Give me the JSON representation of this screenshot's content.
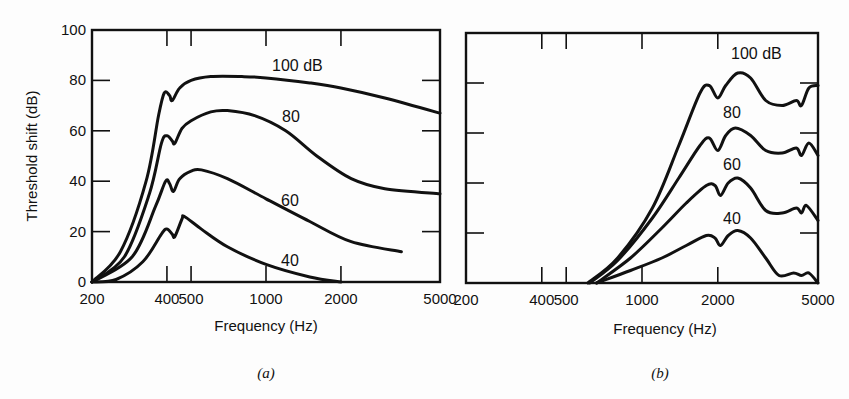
{
  "figure": {
    "panels": [
      {
        "tag": "(a)",
        "xlabel": "Frequency (Hz)",
        "ylabel": "Threshold shift (dB)"
      },
      {
        "tag": "(b)",
        "xlabel": "Frequency (Hz)",
        "ylabel": ""
      }
    ]
  },
  "chart_data": [
    {
      "type": "line",
      "title": "(a)",
      "xlabel": "Frequency (Hz)",
      "ylabel": "Threshold shift (dB)",
      "xscale": "log",
      "xlim": [
        200,
        5000
      ],
      "ylim": [
        0,
        100
      ],
      "xticks": [
        200,
        400,
        500,
        1000,
        2000,
        5000
      ],
      "yticks": [
        0,
        20,
        40,
        60,
        80,
        100
      ],
      "grid": false,
      "legend": "inline curve labels",
      "series": [
        {
          "name": "100 dB",
          "label": "100 dB",
          "points": [
            [
              200,
              0
            ],
            [
              260,
              12
            ],
            [
              330,
              40
            ],
            [
              370,
              66
            ],
            [
              390,
              75
            ],
            [
              410,
              74
            ],
            [
              420,
              72
            ],
            [
              450,
              77
            ],
            [
              500,
              80
            ],
            [
              600,
              81.5
            ],
            [
              800,
              81.5
            ],
            [
              1000,
              81
            ],
            [
              1500,
              79
            ],
            [
              2000,
              77
            ],
            [
              3000,
              73
            ],
            [
              5000,
              67
            ]
          ]
        },
        {
          "name": "80 dB",
          "label": "80",
          "points": [
            [
              200,
              0
            ],
            [
              270,
              10
            ],
            [
              340,
              35
            ],
            [
              380,
              55
            ],
            [
              400,
              58
            ],
            [
              420,
              56
            ],
            [
              430,
              55
            ],
            [
              460,
              61
            ],
            [
              500,
              64
            ],
            [
              600,
              67.5
            ],
            [
              700,
              68
            ],
            [
              900,
              66
            ],
            [
              1200,
              60
            ],
            [
              1600,
              50
            ],
            [
              2200,
              41
            ],
            [
              3000,
              37
            ],
            [
              5000,
              35
            ]
          ]
        },
        {
          "name": "60 dB",
          "label": "60",
          "points": [
            [
              200,
              0
            ],
            [
              290,
              10
            ],
            [
              360,
              30
            ],
            [
              395,
              40
            ],
            [
              410,
              39
            ],
            [
              425,
              36
            ],
            [
              450,
              41
            ],
            [
              500,
              44
            ],
            [
              550,
              44.5
            ],
            [
              700,
              41
            ],
            [
              1000,
              33
            ],
            [
              1500,
              24
            ],
            [
              2200,
              16
            ],
            [
              3500,
              12
            ]
          ]
        },
        {
          "name": "40 dB",
          "label": "40",
          "points": [
            [
              200,
              0
            ],
            [
              250,
              1
            ],
            [
              320,
              8
            ],
            [
              380,
              19
            ],
            [
              400,
              21
            ],
            [
              420,
              19
            ],
            [
              430,
              18
            ],
            [
              460,
              25
            ],
            [
              470,
              26
            ],
            [
              550,
              21
            ],
            [
              700,
              14
            ],
            [
              1000,
              7
            ],
            [
              1500,
              2
            ],
            [
              2000,
              0
            ]
          ]
        }
      ],
      "labels": {
        "curve_100": "100 dB",
        "curve_80": "80",
        "curve_60": "60",
        "curve_40": "40"
      }
    },
    {
      "type": "line",
      "title": "(b)",
      "xlabel": "Frequency (Hz)",
      "ylabel": "",
      "xscale": "log",
      "xlim": [
        200,
        5000
      ],
      "ylim": [
        0,
        100
      ],
      "xticks": [
        200,
        400,
        500,
        1000,
        2000,
        5000
      ],
      "yticks": [
        0,
        20,
        40,
        60,
        80,
        100
      ],
      "grid": false,
      "legend": "inline curve labels",
      "series": [
        {
          "name": "100 dB",
          "label": "100 dB",
          "points": [
            [
              610,
              0
            ],
            [
              800,
              10
            ],
            [
              1100,
              30
            ],
            [
              1400,
              55
            ],
            [
              1700,
              76
            ],
            [
              1850,
              79
            ],
            [
              2000,
              74
            ],
            [
              2150,
              79
            ],
            [
              2400,
              84
            ],
            [
              2700,
              82
            ],
            [
              3100,
              73
            ],
            [
              3600,
              71
            ],
            [
              4100,
              73
            ],
            [
              4300,
              71
            ],
            [
              4600,
              78
            ],
            [
              5000,
              79
            ]
          ]
        },
        {
          "name": "80 dB",
          "label": "80",
          "points": [
            [
              620,
              0
            ],
            [
              800,
              9
            ],
            [
              1100,
              26
            ],
            [
              1400,
              42
            ],
            [
              1700,
              55
            ],
            [
              1850,
              58
            ],
            [
              2000,
              53
            ],
            [
              2150,
              59
            ],
            [
              2350,
              62
            ],
            [
              2700,
              59
            ],
            [
              3100,
              53
            ],
            [
              3600,
              52
            ],
            [
              4100,
              54
            ],
            [
              4300,
              51
            ],
            [
              4600,
              56
            ],
            [
              5000,
              51
            ]
          ]
        },
        {
          "name": "60 dB",
          "label": "60",
          "points": [
            [
              660,
              0
            ],
            [
              900,
              10
            ],
            [
              1200,
              22
            ],
            [
              1500,
              32
            ],
            [
              1800,
              39
            ],
            [
              1950,
              39
            ],
            [
              2050,
              35
            ],
            [
              2200,
              40
            ],
            [
              2400,
              42
            ],
            [
              2700,
              38
            ],
            [
              3100,
              29
            ],
            [
              3600,
              28
            ],
            [
              4100,
              30
            ],
            [
              4300,
              28
            ],
            [
              4500,
              31
            ],
            [
              5000,
              25
            ]
          ]
        },
        {
          "name": "40 dB",
          "label": "40",
          "points": [
            [
              660,
              0
            ],
            [
              900,
              5
            ],
            [
              1200,
              10
            ],
            [
              1500,
              15
            ],
            [
              1800,
              19
            ],
            [
              1950,
              18
            ],
            [
              2050,
              15
            ],
            [
              2200,
              19
            ],
            [
              2400,
              21
            ],
            [
              2700,
              18
            ],
            [
              3100,
              10
            ],
            [
              3500,
              3
            ],
            [
              4000,
              4
            ],
            [
              4300,
              3
            ],
            [
              4600,
              4
            ],
            [
              5000,
              0
            ]
          ]
        }
      ],
      "labels": {
        "curve_100": "100 dB",
        "curve_80": "80",
        "curve_60": "60",
        "curve_40": "40"
      }
    }
  ]
}
